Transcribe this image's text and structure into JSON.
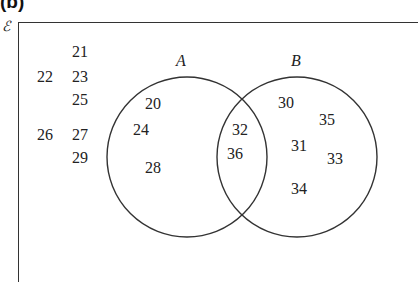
{
  "figure": {
    "part_label": "(b)",
    "universal_symbol": "ℰ",
    "colors": {
      "line": "#333333",
      "text": "#222222",
      "background": "#ffffff"
    }
  },
  "sets": {
    "A": {
      "label": "A",
      "circle": {
        "cx": 187,
        "cy": 157,
        "r": 80
      }
    },
    "B": {
      "label": "B",
      "circle": {
        "cx": 297,
        "cy": 157,
        "r": 80
      }
    }
  },
  "regions": {
    "outside": [
      {
        "value": "21",
        "x": 72,
        "y": 44
      },
      {
        "value": "22",
        "x": 37,
        "y": 69
      },
      {
        "value": "23",
        "x": 72,
        "y": 69
      },
      {
        "value": "25",
        "x": 72,
        "y": 92
      },
      {
        "value": "26",
        "x": 37,
        "y": 127
      },
      {
        "value": "27",
        "x": 72,
        "y": 127
      },
      {
        "value": "29",
        "x": 72,
        "y": 150
      }
    ],
    "A_only": [
      {
        "value": "20",
        "x": 145,
        "y": 96
      },
      {
        "value": "24",
        "x": 133,
        "y": 122
      },
      {
        "value": "28",
        "x": 145,
        "y": 160
      }
    ],
    "A_and_B": [
      {
        "value": "32",
        "x": 232,
        "y": 122
      },
      {
        "value": "36",
        "x": 227,
        "y": 146
      }
    ],
    "B_only": [
      {
        "value": "30",
        "x": 278,
        "y": 95
      },
      {
        "value": "35",
        "x": 319,
        "y": 112
      },
      {
        "value": "31",
        "x": 291,
        "y": 138
      },
      {
        "value": "33",
        "x": 327,
        "y": 151
      },
      {
        "value": "34",
        "x": 291,
        "y": 181
      }
    ]
  }
}
